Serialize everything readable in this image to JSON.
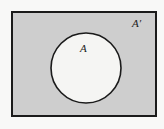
{
  "figure": {
    "type": "venn-diagram",
    "canvas": {
      "width": 164,
      "height": 129
    },
    "colors": {
      "page_background": "#f8f8f7",
      "universal_set_fill": "#cecece",
      "set_a_fill": "#f5f5f3",
      "stroke": "#1b1b1b"
    },
    "universal_set": {
      "shape": "rectangle",
      "x": 11,
      "y": 11,
      "width": 146,
      "height": 106,
      "stroke_width": 2
    },
    "set_a": {
      "shape": "circle",
      "cx": 86,
      "cy": 68,
      "r": 35,
      "stroke_width": 1.6
    },
    "labels": {
      "set_a": "A",
      "complement": "A′"
    }
  }
}
